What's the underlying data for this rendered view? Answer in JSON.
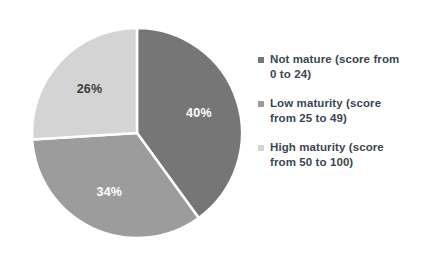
{
  "chart_data": {
    "type": "pie",
    "title": "",
    "legend_position": "right",
    "categories": [
      "Not mature (score from 0 to 24)",
      "Low maturity (score from 25 to 49)",
      "High maturity (score from 50 to 100)"
    ],
    "values": [
      40,
      34,
      26
    ],
    "data_labels": [
      "40%",
      "34%",
      "26%"
    ],
    "colors": [
      "#767676",
      "#9c9c9c",
      "#d4d4d4"
    ],
    "start_angle_deg": 0,
    "direction": "clockwise",
    "separator_color": "#ffffff",
    "grid": false,
    "xlabel": "",
    "ylabel": ""
  },
  "pie": {
    "slices": [
      {
        "name": "not-mature",
        "label": "40%",
        "value": 40,
        "color": "#767676",
        "label_color": "light"
      },
      {
        "name": "low-maturity",
        "label": "34%",
        "value": 34,
        "color": "#9c9c9c",
        "label_color": "light"
      },
      {
        "name": "high-maturity",
        "label": "26%",
        "value": 26,
        "color": "#d4d4d4",
        "label_color": "dark"
      }
    ]
  },
  "legend": {
    "items": [
      {
        "swatch_color": "#767676",
        "line1": "Not mature (score from",
        "line2": "0 to 24)"
      },
      {
        "swatch_color": "#9c9c9c",
        "line1": "Low maturity (score",
        "line2": "from 25 to 49)"
      },
      {
        "swatch_color": "#d4d4d4",
        "line1": "High maturity (score",
        "line2": "from 50 to 100)"
      }
    ]
  }
}
